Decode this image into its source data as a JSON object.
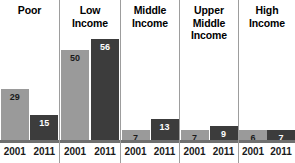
{
  "chart_data": {
    "type": "bar",
    "title": "",
    "subtitle": "",
    "xlabel": "",
    "ylabel": "",
    "ylim": [
      0,
      60
    ],
    "grid": false,
    "legend_position": "none",
    "categories": [
      "Poor",
      "Low Income",
      "Middle Income",
      "Upper Middle Income",
      "High Income"
    ],
    "x": [
      "2001",
      "2011"
    ],
    "series": [
      {
        "name": "2001",
        "values": [
          29,
          50,
          7,
          7,
          6
        ],
        "color": "#9a9a9a"
      },
      {
        "name": "2011",
        "values": [
          15,
          56,
          13,
          9,
          7
        ],
        "color": "#3c3c3c"
      }
    ],
    "data_labels": [
      {
        "category": "Poor",
        "2001": 29,
        "2011": 15
      },
      {
        "category": "Low Income",
        "2001": 50,
        "2011": 56
      },
      {
        "category": "Middle Income",
        "2001": 7,
        "2011": 13
      },
      {
        "category": "Upper Middle Income",
        "2001": 7,
        "2011": 9
      },
      {
        "category": "High Income",
        "2001": 6,
        "2011": 7
      }
    ]
  },
  "groups": [
    {
      "title": "Poor",
      "bars": [
        {
          "year": "2001",
          "value": "29",
          "shade": "light"
        },
        {
          "year": "2011",
          "value": "15",
          "shade": "dark"
        }
      ]
    },
    {
      "title": "Low\nIncome",
      "bars": [
        {
          "year": "2001",
          "value": "50",
          "shade": "light"
        },
        {
          "year": "2011",
          "value": "56",
          "shade": "dark"
        }
      ]
    },
    {
      "title": "Middle\nIncome",
      "bars": [
        {
          "year": "2001",
          "value": "7",
          "shade": "light"
        },
        {
          "year": "2011",
          "value": "13",
          "shade": "dark"
        }
      ]
    },
    {
      "title": "Upper\nMiddle\nIncome",
      "bars": [
        {
          "year": "2001",
          "value": "7",
          "shade": "light"
        },
        {
          "year": "2011",
          "value": "9",
          "shade": "dark"
        }
      ]
    },
    {
      "title": "High\nIncome",
      "bars": [
        {
          "year": "2001",
          "value": "6",
          "shade": "light"
        },
        {
          "year": "2011",
          "value": "7",
          "shade": "dark"
        }
      ]
    }
  ],
  "colors": {
    "bar_2001": "#9a9a9a",
    "bar_2011": "#3c3c3c",
    "baseline": "#6f6f6f",
    "divider": "#9d9d9d",
    "background": "#ffffff",
    "title_text": "#000000"
  }
}
